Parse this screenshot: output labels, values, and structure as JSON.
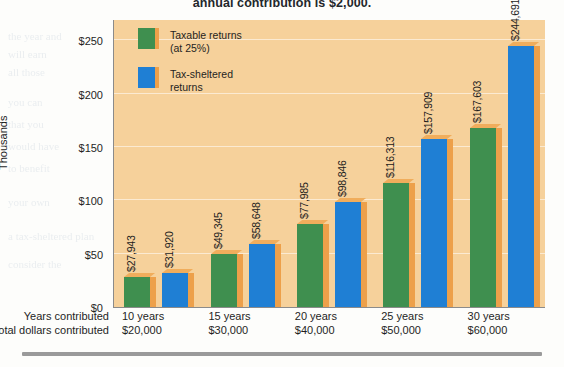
{
  "page": {
    "top_text": "annual contribution is $2,000."
  },
  "chart_data": {
    "type": "bar",
    "title": "",
    "xlabel": "",
    "ylabel": "Thousands",
    "ylim": [
      0,
      270
    ],
    "yticks": [
      "$0",
      "$50",
      "$100",
      "$150",
      "$200",
      "$250"
    ],
    "ytick_values": [
      0,
      50,
      100,
      150,
      200,
      250
    ],
    "grid": true,
    "legend_position": "top-left-inside",
    "categories": [
      "10 years",
      "15 years",
      "20 years",
      "25 years",
      "30 years"
    ],
    "axis_rows": [
      {
        "label": "Years contributed",
        "values": [
          "10 years",
          "15 years",
          "20 years",
          "25 years",
          "30 years"
        ]
      },
      {
        "label": "Total dollars contributed",
        "values": [
          "$20,000",
          "$30,000",
          "$40,000",
          "$50,000",
          "$60,000"
        ]
      }
    ],
    "series": [
      {
        "name": "Taxable returns (at 25%)",
        "legend_line1": "Taxable returns",
        "legend_line2": "(at 25%)",
        "color": "#3f8f4f",
        "values": [
          27943,
          49345,
          77985,
          116313,
          167603
        ],
        "labels": [
          "$27,943",
          "$49,345",
          "$77,985",
          "$116,313",
          "$167,603"
        ]
      },
      {
        "name": "Tax-sheltered returns",
        "legend_line1": "Tax-sheltered",
        "legend_line2": "returns",
        "color": "#1f7fd4",
        "values": [
          31920,
          58648,
          98846,
          157909,
          244691
        ],
        "labels": [
          "$31,920",
          "$58,648",
          "$98,846",
          "$157,909",
          "$244,691"
        ]
      }
    ],
    "colors": {
      "plot_background": "#f6d19b",
      "bar_shadow": "#eda04a",
      "axis": "#8b8b8b",
      "text": "#1f1f1f"
    }
  },
  "bleed_text": [
    "the year and",
    "will earn",
    "all those",
    "you can",
    "that you",
    "would have",
    "to benefit",
    "your own",
    "a tax-sheltered plan",
    "consider the",
    "amount is",
    "contribution",
    "investment grows",
    "over time the",
    "difference is"
  ]
}
